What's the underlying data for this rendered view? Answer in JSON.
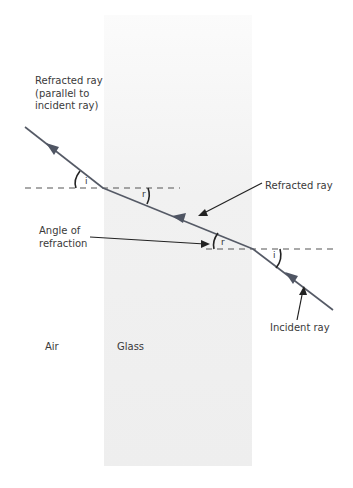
{
  "diagram": {
    "labels": {
      "refracted_ray_out": "Refracted ray\n(parallel to\nincident ray)",
      "refracted_ray_in": "Refracted ray",
      "angle_of_refraction": "Angle of\nrefraction",
      "incident_ray": "Incident ray",
      "air": "Air",
      "glass": "Glass"
    },
    "angle_symbols": {
      "i_exit": "i",
      "r_exit": "r",
      "r_entry": "r",
      "i_entry": "i"
    },
    "colors": {
      "ray": "#555a66",
      "arrow_head": "#4f5563",
      "normal_dash": "#555555",
      "pointer": "#222222",
      "glass_fill": "#efefef"
    }
  }
}
